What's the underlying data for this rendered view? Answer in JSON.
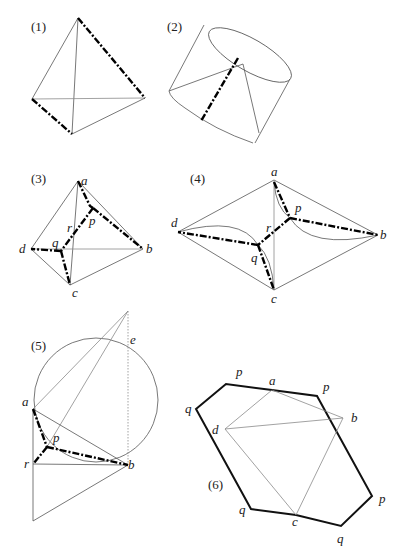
{
  "figures": [
    {
      "id": "fig1",
      "label": "(1)",
      "description": "Tetrahedron with two opposite edges drawn dash-dot"
    },
    {
      "id": "fig2",
      "label": "(2)",
      "description": "Truncated cone with a dash-dot generator segment"
    },
    {
      "id": "fig3",
      "label": "(3)",
      "vertices": {
        "a": "a",
        "b": "b",
        "c": "c",
        "d": "d",
        "p": "p",
        "q": "q",
        "r": "r"
      }
    },
    {
      "id": "fig4",
      "label": "(4)",
      "vertices": {
        "a": "a",
        "b": "b",
        "c": "c",
        "d": "d",
        "p": "p",
        "q": "q",
        "r": "r"
      }
    },
    {
      "id": "fig5",
      "label": "(5)",
      "vertices": {
        "a": "a",
        "b": "b",
        "e": "e",
        "p": "p",
        "r": "r"
      }
    },
    {
      "id": "fig6",
      "label": "(6)",
      "vertices": {
        "a": "a",
        "b": "b",
        "c": "c",
        "d": "d",
        "p1": "p",
        "p2": "p",
        "p3": "p",
        "q1": "q",
        "q2": "q",
        "q3": "q"
      }
    }
  ],
  "colors": {
    "bold": "#111111",
    "thin": "#555555",
    "grey": "#8a8a8a",
    "background": "#ffffff"
  }
}
